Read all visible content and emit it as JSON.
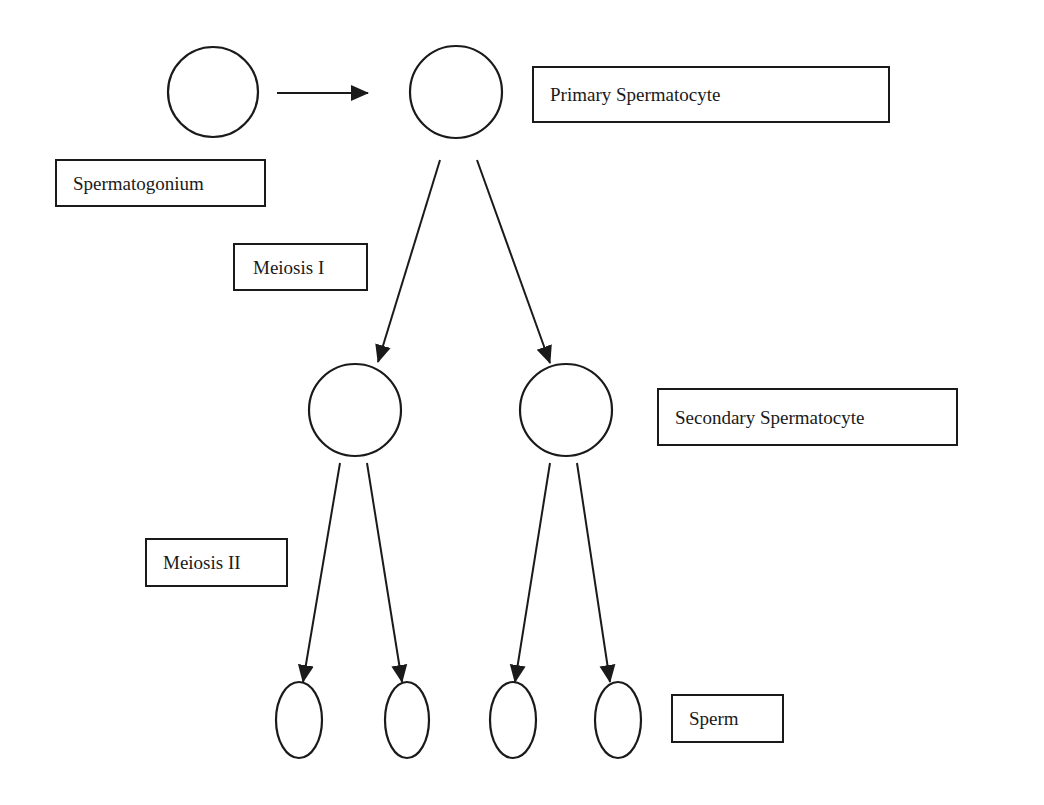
{
  "diagram": {
    "labels": {
      "spermatogonium": "Spermatogonium",
      "primary": "Primary Spermatocyte",
      "meiosis1": "Meiosis I",
      "secondary": "Secondary Spermatocyte",
      "meiosis2": "Meiosis II",
      "sperm": "Sperm"
    },
    "nodes": [
      {
        "id": "spermatogonium",
        "shape": "circle",
        "count": 1
      },
      {
        "id": "primary-spermatocyte",
        "shape": "circle",
        "count": 1
      },
      {
        "id": "secondary-spermatocyte",
        "shape": "circle",
        "count": 2
      },
      {
        "id": "sperm",
        "shape": "ellipse",
        "count": 4
      }
    ],
    "edges": [
      {
        "from": "spermatogonium",
        "to": "primary-spermatocyte"
      },
      {
        "from": "primary-spermatocyte",
        "to": "secondary-spermatocyte-1",
        "stage": "Meiosis I"
      },
      {
        "from": "primary-spermatocyte",
        "to": "secondary-spermatocyte-2",
        "stage": "Meiosis I"
      },
      {
        "from": "secondary-spermatocyte-1",
        "to": "sperm-1",
        "stage": "Meiosis II"
      },
      {
        "from": "secondary-spermatocyte-1",
        "to": "sperm-2",
        "stage": "Meiosis II"
      },
      {
        "from": "secondary-spermatocyte-2",
        "to": "sperm-3",
        "stage": "Meiosis II"
      },
      {
        "from": "secondary-spermatocyte-2",
        "to": "sperm-4",
        "stage": "Meiosis II"
      }
    ],
    "colors": {
      "stroke": "#1a1a1a",
      "background": "#ffffff"
    }
  }
}
